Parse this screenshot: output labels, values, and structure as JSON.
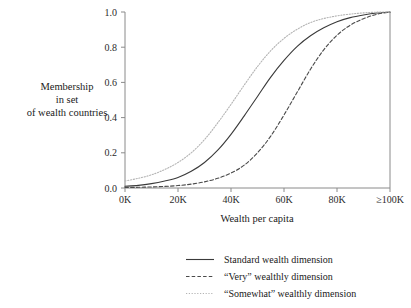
{
  "chart_data": {
    "type": "line",
    "title": "",
    "xlabel": "Wealth per capita",
    "ylabel": "Membership\nin set\nof wealth countries",
    "ylabel_lines": [
      "Membership",
      "in set",
      "of wealth countries"
    ],
    "xlim": [
      0,
      100
    ],
    "ylim": [
      0,
      1
    ],
    "grid": false,
    "legend_position": "bottom",
    "x_tick_values": [
      0,
      20,
      40,
      60,
      80,
      100
    ],
    "x_tick_labels": [
      "0K",
      "20K",
      "40K",
      "60K",
      "80K",
      "≥100K"
    ],
    "y_tick_values": [
      0.0,
      0.2,
      0.4,
      0.6,
      0.8,
      1.0
    ],
    "y_tick_labels": [
      "0.0",
      "0.2",
      "0.4",
      "0.6",
      "0.8",
      "1.0"
    ],
    "x": [
      0,
      5,
      10,
      15,
      20,
      25,
      30,
      35,
      40,
      45,
      50,
      55,
      60,
      65,
      70,
      75,
      80,
      85,
      90,
      95,
      100
    ],
    "series": [
      {
        "name": "Standard wealth dimension",
        "style": "solid",
        "color": "#3a3a3a",
        "width": 1.1,
        "values": [
          0.01,
          0.015,
          0.025,
          0.04,
          0.06,
          0.095,
          0.145,
          0.215,
          0.305,
          0.41,
          0.52,
          0.63,
          0.725,
          0.805,
          0.865,
          0.91,
          0.945,
          0.968,
          0.983,
          0.994,
          1.0
        ]
      },
      {
        "name": "“Very” wealthly dimension",
        "style": "dashed",
        "color": "#4a4a4a",
        "width": 1.1,
        "values": [
          0.003,
          0.004,
          0.006,
          0.009,
          0.014,
          0.022,
          0.035,
          0.055,
          0.085,
          0.13,
          0.2,
          0.295,
          0.415,
          0.545,
          0.675,
          0.785,
          0.868,
          0.925,
          0.962,
          0.987,
          1.0
        ]
      },
      {
        "name": "“Somewhat” wealthly dimension",
        "style": "dotted",
        "color": "#b4b4b4",
        "width": 1.1,
        "values": [
          0.04,
          0.055,
          0.075,
          0.105,
          0.145,
          0.2,
          0.275,
          0.37,
          0.475,
          0.585,
          0.69,
          0.78,
          0.85,
          0.902,
          0.94,
          0.963,
          0.978,
          0.988,
          0.995,
          0.999,
          1.0
        ]
      }
    ]
  },
  "legend": {
    "items": [
      {
        "label": "Standard wealth dimension",
        "style": "solid",
        "color": "#3a3a3a"
      },
      {
        "label": "“Very” wealthly dimension",
        "style": "dashed",
        "color": "#4a4a4a"
      },
      {
        "label": "“Somewhat” wealthly dimension",
        "style": "dotted",
        "color": "#b4b4b4"
      }
    ]
  },
  "colors": {
    "axis": "#8a8a8a",
    "text": "#1a1a1a",
    "background": "#ffffff"
  }
}
